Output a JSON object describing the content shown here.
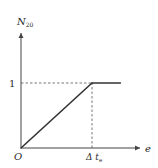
{
  "chart_data": {
    "type": "line",
    "title": "",
    "ylabel": "N",
    "ylabel_sub": "20",
    "xlabel": "e",
    "origin_label": "O",
    "x_ticks": [
      {
        "value": 1,
        "label": "Δ t",
        "sub": "e"
      }
    ],
    "y_ticks": [
      {
        "value": 1,
        "label": "1"
      }
    ],
    "xlim": [
      0,
      1.5
    ],
    "ylim": [
      0,
      1.5
    ],
    "grid": false,
    "series": [
      {
        "name": "N20",
        "x": [
          0,
          1,
          1.4
        ],
        "y": [
          0,
          1,
          1
        ],
        "color": "#333333"
      }
    ],
    "reference_lines": [
      {
        "type": "horizontal",
        "y": 1,
        "x_from": 0,
        "x_to": 1,
        "style": "dashed",
        "color": "#555555"
      },
      {
        "type": "vertical",
        "x": 1,
        "y_from": 0,
        "y_to": 1,
        "style": "dashed",
        "color": "#555555"
      }
    ],
    "axis_color": "#444444"
  }
}
